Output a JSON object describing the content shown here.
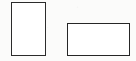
{
  "figure": {
    "canvas": {
      "width": 136,
      "height": 61,
      "background_color": "#fbfbfa",
      "units": "px"
    },
    "shapes": [
      {
        "name": "portrait-rectangle",
        "type": "rectangle",
        "orientation": "portrait",
        "label": "",
        "x": 11,
        "y": 2,
        "width": 35,
        "height": 54,
        "stroke_color": "#2b2b2b",
        "stroke_width": 1.6,
        "fill_color": "#ffffff"
      },
      {
        "name": "landscape-rectangle",
        "type": "rectangle",
        "orientation": "landscape",
        "label": "",
        "x": 67,
        "y": 23,
        "width": 63,
        "height": 33,
        "stroke_color": "#262626",
        "stroke_width": 1.7,
        "fill_color": "#ffffff"
      }
    ]
  }
}
